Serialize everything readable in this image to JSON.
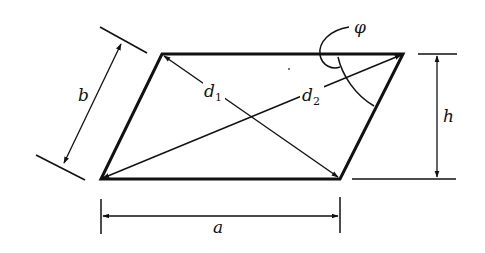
{
  "diagram": {
    "colors": {
      "stroke": "#111111",
      "background": "#ffffff"
    },
    "shape": {
      "type": "parallelogram",
      "vertices": {
        "bottom_left": [
          101,
          179
        ],
        "bottom_right": [
          340,
          179
        ],
        "top_right": [
          403,
          54
        ],
        "top_left": [
          162,
          54
        ]
      }
    },
    "labels": {
      "side_a": "a",
      "side_b": "b",
      "height": "h",
      "diagonal_1": "d",
      "diagonal_1_sub": "1",
      "diagonal_2": "d",
      "diagonal_2_sub": "2",
      "angle": "φ"
    },
    "dimensions": [
      {
        "name": "a",
        "kind": "horizontal",
        "from": [
          101,
          216
        ],
        "to": [
          340,
          216
        ]
      },
      {
        "name": "b",
        "kind": "slanted",
        "from": [
          122,
          42
        ],
        "to": [
          63,
          165
        ]
      },
      {
        "name": "h",
        "kind": "vertical",
        "from": [
          437,
          54
        ],
        "to": [
          437,
          179
        ]
      }
    ],
    "diagonals": [
      {
        "name": "d1",
        "from": [
          340,
          179
        ],
        "to": [
          162,
          54
        ]
      },
      {
        "name": "d2",
        "from": [
          101,
          179
        ],
        "to": [
          403,
          54
        ]
      }
    ]
  }
}
